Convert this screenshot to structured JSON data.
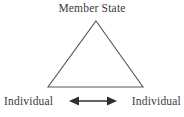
{
  "diagram": {
    "type": "triangle-relationship-diagram",
    "apex": {
      "label": "Member State"
    },
    "bottom_left": {
      "label": "Individual"
    },
    "bottom_right": {
      "label": "Individual"
    },
    "connector": {
      "icon": "double-headed-arrow-icon",
      "direction": "bidirectional",
      "orientation": "horizontal"
    },
    "shape": {
      "name": "triangle-outline",
      "fill": "none",
      "stroke_color": "#555555",
      "apex_point": [
        96,
        21
      ],
      "base_left_point": [
        48,
        87
      ],
      "base_right_point": [
        143,
        87
      ]
    },
    "colors": {
      "background": "#ffffff",
      "text": "#3a3a3a",
      "line": "#555555",
      "arrow": "#2f2f2f"
    }
  }
}
